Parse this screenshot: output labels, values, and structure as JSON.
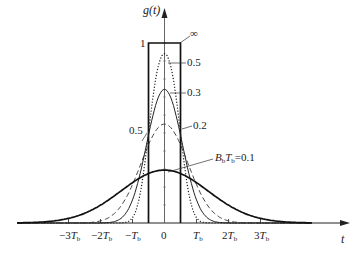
{
  "chart_data": {
    "type": "line",
    "title": "",
    "xlabel": "t",
    "ylabel": "g(t)",
    "x_unit": "T_b",
    "x_ticks": [
      -3,
      -2,
      -1,
      0,
      1,
      2,
      3
    ],
    "x_tick_labels": [
      "-3T_b",
      "-2T_b",
      "-T_b",
      "0",
      "T_b",
      "2T_b",
      "3T_b"
    ],
    "y_tick_labels": [
      "1",
      "0.5"
    ],
    "y_ticks": [
      1,
      0.5
    ],
    "xlim": [
      -4.6,
      5.6
    ],
    "ylim": [
      0,
      1.12
    ],
    "grid": false,
    "legend": "none (inline leader-line annotations)",
    "series": [
      {
        "name": "∞",
        "label": "∞",
        "style": "solid-thick",
        "shape": "rect",
        "x": [
          -0.5,
          -0.5,
          0.5,
          0.5
        ],
        "y": [
          0,
          1,
          1,
          0
        ],
        "peak": 1.0
      },
      {
        "name": "0.5",
        "label": "0.5",
        "style": "dotted",
        "bt": 0.5,
        "peak": 0.89
      },
      {
        "name": "0.3",
        "label": "0.3",
        "style": "solid-thin",
        "bt": 0.3,
        "peak": 0.73
      },
      {
        "name": "0.2",
        "label": "0.2",
        "style": "dashed",
        "bt": 0.2,
        "peak": 0.54
      },
      {
        "name": "0.1",
        "label": "B_bT_b=0.1",
        "style": "solid-thick",
        "bt": 0.1,
        "peak": 0.29
      }
    ],
    "annotations": [
      {
        "text": "∞",
        "target": "rect top-right corner"
      },
      {
        "text": "0.5",
        "target": "dotted curve peak"
      },
      {
        "text": "0.3",
        "target": "0.3 curve peak"
      },
      {
        "text": "0.2",
        "target": "dashed curve"
      },
      {
        "text": "B_bT_b=0.1",
        "target": "bold curve peak"
      },
      {
        "text": "0.5",
        "target": "y-level 0.5 at rectangle left edge"
      }
    ]
  },
  "labels": {
    "y_axis": "g(t)",
    "x_axis": "t",
    "one": "1",
    "half": "0.5",
    "inf": "∞",
    "c05": "0.5",
    "c03": "0.3",
    "c02": "0.2",
    "c01_prefix": "B",
    "c01_sub1": "b",
    "c01_mid": "T",
    "c01_sub2": "b",
    "c01_val": "=0.1",
    "ticks": {
      "m3": "−3",
      "m2": "−2",
      "m1": "−",
      "zero": "0",
      "p1": "",
      "p2": "2",
      "p3": "3",
      "T": "T",
      "b": "b"
    }
  }
}
